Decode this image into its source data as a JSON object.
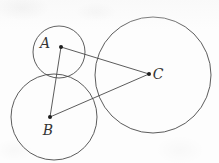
{
  "figure": {
    "width": 219,
    "height": 163,
    "background_color": "#fdfdfd",
    "stroke_color": "#4a4a4a",
    "label_color": "#353535",
    "dot_color": "#1e1e1e",
    "circle_stroke_width": 0.9,
    "segment_stroke_width": 0.9,
    "dot_radius": 2.0
  },
  "circles": [
    {
      "id": "circle-a",
      "center_label": "A",
      "cx": 59,
      "cy": 52,
      "r": 26
    },
    {
      "id": "circle-b",
      "center_label": "B",
      "cx": 54,
      "cy": 117,
      "r": 43
    },
    {
      "id": "circle-c",
      "center_label": "C",
      "cx": 153,
      "cy": 75,
      "r": 58
    }
  ],
  "points": [
    {
      "id": "point-a",
      "label": "A",
      "x": 61,
      "y": 47,
      "label_x": 45,
      "label_y": 48
    },
    {
      "id": "point-b",
      "label": "B",
      "x": 50,
      "y": 117,
      "label_x": 43,
      "label_y": 135
    },
    {
      "id": "point-c",
      "label": "C",
      "x": 149,
      "y": 74,
      "label_x": 153,
      "label_y": 78
    }
  ],
  "segments": [
    {
      "id": "segment-ab",
      "label": "AB",
      "x1": 61,
      "y1": 47,
      "x2": 50,
      "y2": 117
    },
    {
      "id": "segment-ac",
      "label": "AC",
      "x1": 61,
      "y1": 47,
      "x2": 149,
      "y2": 74
    },
    {
      "id": "segment-bc",
      "label": "BC",
      "x1": 50,
      "y1": 117,
      "x2": 149,
      "y2": 74
    }
  ],
  "labels": {
    "a": "A",
    "b": "B",
    "c": "C"
  }
}
